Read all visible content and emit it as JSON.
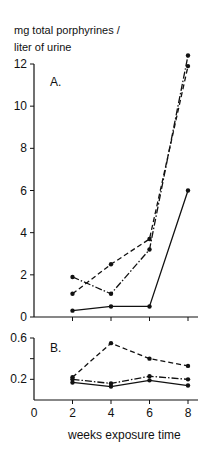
{
  "chart_data": [
    {
      "type": "line",
      "panel": "A.",
      "title": "",
      "ylabel": "mg total porphyrines / liter of urine",
      "xlabel": "",
      "x": [
        2,
        4,
        6,
        8
      ],
      "xlim": [
        0,
        8
      ],
      "ylim": [
        0,
        12
      ],
      "yticks": [
        0,
        2,
        4,
        6,
        8,
        10,
        12
      ],
      "grid": false,
      "legend": "none",
      "series": [
        {
          "name": "solid",
          "style": "solid",
          "values": [
            0.3,
            0.5,
            0.5,
            6.0
          ]
        },
        {
          "name": "dashed",
          "style": "dashed",
          "values": [
            1.1,
            2.5,
            3.7,
            11.9
          ]
        },
        {
          "name": "dash-dot",
          "style": "dashdot",
          "values": [
            1.9,
            1.1,
            3.2,
            12.4
          ]
        }
      ]
    },
    {
      "type": "line",
      "panel": "B.",
      "title": "",
      "ylabel": "",
      "xlabel": "weeks exposure time",
      "x": [
        2,
        4,
        6,
        8
      ],
      "xlim": [
        0,
        8
      ],
      "ylim": [
        0,
        0.6
      ],
      "yticks": [
        0.2,
        0.4,
        0.6
      ],
      "ytick_labels": [
        "0.2",
        "",
        "0.6"
      ],
      "xticks": [
        0,
        2,
        4,
        6,
        8
      ],
      "grid": false,
      "legend": "none",
      "series": [
        {
          "name": "solid",
          "style": "solid",
          "values": [
            0.17,
            0.13,
            0.19,
            0.14
          ]
        },
        {
          "name": "dashed",
          "style": "dashed",
          "values": [
            0.22,
            0.55,
            0.4,
            0.33
          ]
        },
        {
          "name": "dash-dot",
          "style": "dashdot",
          "values": [
            0.2,
            0.16,
            0.23,
            0.2
          ]
        }
      ]
    }
  ],
  "labels": {
    "ylabel": "mg total porphyrines /\nliter of urine",
    "panel_a": "A.",
    "panel_b": "B.",
    "xlabel": "weeks exposure time",
    "a_yticks": [
      "0",
      "2",
      "4",
      "6",
      "8",
      "10",
      "12"
    ],
    "b_yticks": [
      "0.2",
      "0.6"
    ],
    "xticks": [
      "0",
      "2",
      "4",
      "6",
      "8"
    ]
  },
  "colors": {
    "ink": "#111111",
    "background": "#ffffff"
  }
}
